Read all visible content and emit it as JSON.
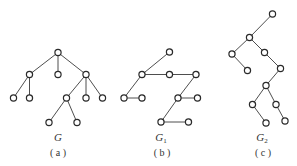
{
  "diagram": {
    "stroke_color": "#2a2a2a",
    "node_radius": 3.1,
    "graphs": [
      {
        "id": "G",
        "name": "G",
        "subscript": "",
        "caption": "( a )",
        "label_pos": [
          58,
          141
        ],
        "caption_pos": [
          58,
          156
        ],
        "nodes": [
          [
            58,
            52.5
          ],
          [
            29.5,
            74.5
          ],
          [
            58,
            74.5
          ],
          [
            86,
            74.5
          ],
          [
            13.5,
            98
          ],
          [
            29.5,
            98
          ],
          [
            66.5,
            98
          ],
          [
            86,
            98
          ],
          [
            102.5,
            98
          ],
          [
            49,
            122.5
          ],
          [
            77,
            122.5
          ]
        ],
        "edges": [
          [
            0,
            1
          ],
          [
            0,
            2
          ],
          [
            0,
            3
          ],
          [
            1,
            4
          ],
          [
            1,
            5
          ],
          [
            3,
            6
          ],
          [
            3,
            7
          ],
          [
            3,
            8
          ],
          [
            6,
            9
          ],
          [
            6,
            10
          ]
        ]
      },
      {
        "id": "G1",
        "name": "G",
        "subscript": "1",
        "caption": "( b )",
        "label_pos": [
          161,
          141
        ],
        "caption_pos": [
          162,
          156
        ],
        "nodes": [
          [
            169.5,
            52
          ],
          [
            142,
            74.5
          ],
          [
            169.5,
            74.5
          ],
          [
            196,
            74.5
          ],
          [
            124,
            98
          ],
          [
            142,
            98
          ],
          [
            178,
            98
          ],
          [
            197.5,
            98
          ],
          [
            161,
            122
          ],
          [
            188.5,
            122
          ]
        ],
        "edges": [
          [
            1,
            0
          ],
          [
            1,
            2
          ],
          [
            2,
            3
          ],
          [
            1,
            4
          ],
          [
            4,
            5
          ],
          [
            3,
            6
          ],
          [
            6,
            7
          ],
          [
            6,
            8
          ],
          [
            8,
            9
          ]
        ]
      },
      {
        "id": "G2",
        "name": "G",
        "subscript": "2",
        "caption": "( c )",
        "label_pos": [
          262,
          141
        ],
        "caption_pos": [
          263,
          156
        ],
        "nodes": [
          [
            272.5,
            14
          ],
          [
            249.5,
            37.5
          ],
          [
            232,
            54
          ],
          [
            264.5,
            52.5
          ],
          [
            247.5,
            70.5
          ],
          [
            280.5,
            68.5
          ],
          [
            266,
            85.5
          ],
          [
            252.5,
            104.5
          ],
          [
            276,
            104.5
          ],
          [
            266,
            123
          ],
          [
            285,
            121
          ]
        ],
        "edges": [
          [
            0,
            1
          ],
          [
            1,
            2
          ],
          [
            1,
            3
          ],
          [
            2,
            4
          ],
          [
            3,
            5
          ],
          [
            5,
            6
          ],
          [
            6,
            7
          ],
          [
            6,
            8
          ],
          [
            7,
            9
          ],
          [
            8,
            10
          ]
        ]
      }
    ]
  }
}
